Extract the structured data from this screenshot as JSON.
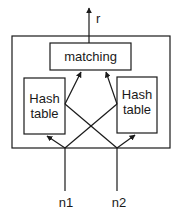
{
  "diagram": {
    "output_label": "r",
    "matching_label": "matching",
    "left_table": {
      "line1": "Hash",
      "line2": "table"
    },
    "right_table": {
      "line1": "Hash",
      "line2": "table"
    },
    "input_left": "n1",
    "input_right": "n2",
    "colors": {
      "stroke": "#1a1a1a",
      "background": "#ffffff"
    }
  }
}
